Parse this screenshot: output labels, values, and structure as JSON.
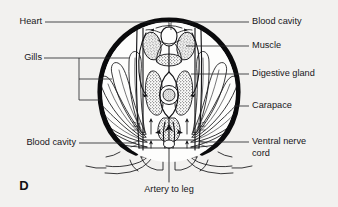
{
  "figure": {
    "letter": "D",
    "background_color": "#f2f1ef",
    "ink_color": "#151518",
    "carapace_color": "#0a0a0c"
  },
  "labels": {
    "left": [
      {
        "id": "heart",
        "text": "Heart",
        "points_to": "heart"
      },
      {
        "id": "gills",
        "text": "Gills",
        "points_to": "gill-filaments"
      },
      {
        "id": "blood-cavity-left",
        "text": "Blood cavity",
        "points_to": "ventral-blood-sinus"
      }
    ],
    "right": [
      {
        "id": "blood-cavity-right",
        "text": "Blood cavity",
        "points_to": "dorsal-blood-sinus"
      },
      {
        "id": "muscle",
        "text": "Muscle",
        "points_to": "dorsal-muscle-block"
      },
      {
        "id": "digestive-gland",
        "text": "Digestive gland",
        "points_to": "digestive-gland-mass"
      },
      {
        "id": "carapace",
        "text": "Carapace",
        "points_to": "carapace-wall"
      },
      {
        "id": "ventral-nerve-cord",
        "text": "Ventral nerve\ncord",
        "line1": "Ventral nerve",
        "line2": "cord",
        "points_to": "nerve-cord"
      }
    ],
    "bottom": [
      {
        "id": "artery-to-leg",
        "text": "Artery to leg",
        "points_to": "leg-artery"
      }
    ]
  },
  "structures": [
    {
      "id": "carapace-wall",
      "name": "carapace"
    },
    {
      "id": "heart",
      "name": "heart"
    },
    {
      "id": "gill-filaments",
      "name": "gills"
    },
    {
      "id": "digestive-gland-mass",
      "name": "digestive gland"
    },
    {
      "id": "dorsal-muscle-block",
      "name": "muscle"
    },
    {
      "id": "gut",
      "name": "gut"
    },
    {
      "id": "nerve-cord",
      "name": "ventral nerve cord"
    },
    {
      "id": "leg-artery",
      "name": "artery to leg"
    },
    {
      "id": "walking-legs",
      "name": "walking legs"
    }
  ]
}
